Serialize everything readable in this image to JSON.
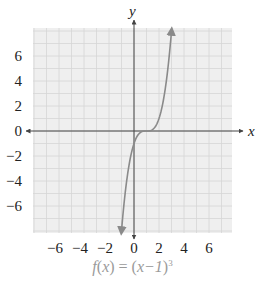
{
  "chart_data": {
    "type": "line",
    "title": "",
    "caption": "f(x) = (x−1)^3",
    "caption_parts": {
      "lhs": "f",
      "arg": "x",
      "eq": "=",
      "rhs_inner": "x−1",
      "exponent": "3"
    },
    "function": "(x-1)^3",
    "xlabel": "x",
    "ylabel": "y",
    "xlim": [
      -8,
      8
    ],
    "ylim": [
      -8,
      8
    ],
    "x_ticks": [
      -6,
      -4,
      -2,
      0,
      2,
      4,
      6
    ],
    "y_ticks": [
      6,
      4,
      2,
      0,
      -2,
      -4,
      -6
    ],
    "x_tick_labels": [
      "−6",
      "−4",
      "−2",
      "0",
      "2",
      "4",
      "6"
    ],
    "y_tick_labels": [
      "6",
      "4",
      "2",
      "0",
      "−2",
      "−4",
      "−6"
    ],
    "grid": true,
    "grid_step": 1,
    "series": [
      {
        "name": "f(x) = (x−1)^3",
        "x": [
          -1,
          -0.5,
          0,
          0.5,
          1,
          1.5,
          2,
          2.5,
          3
        ],
        "y": [
          -8,
          -3.375,
          -1,
          -0.125,
          0,
          0.125,
          1,
          3.375,
          8
        ],
        "arrows": "both"
      }
    ],
    "legend": null
  },
  "colors": {
    "grid_background": "#efefef",
    "grid_line": "#d6d6d6",
    "axis": "#444444",
    "curve": "#8a8a8a",
    "tick_text": "#222222",
    "caption_text": "#9a9a9a"
  }
}
